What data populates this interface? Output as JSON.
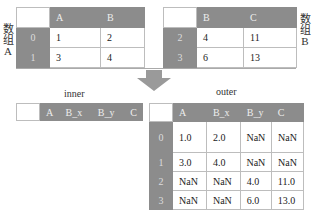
{
  "table_a": {
    "label_chars": [
      "数",
      "组",
      "A"
    ],
    "columns": [
      "A",
      "B"
    ],
    "rows": [
      {
        "index": "0",
        "values": [
          "1",
          "2"
        ]
      },
      {
        "index": "1",
        "values": [
          "3",
          "4"
        ]
      }
    ]
  },
  "table_b": {
    "label_chars": [
      "数",
      "组",
      "B"
    ],
    "columns": [
      "B",
      "C"
    ],
    "rows": [
      {
        "index": "2",
        "values": [
          "4",
          "11"
        ]
      },
      {
        "index": "3",
        "values": [
          "6",
          "13"
        ]
      }
    ]
  },
  "inner": {
    "caption": "inner",
    "columns": [
      "A",
      "B_x",
      "B_y",
      "C"
    ]
  },
  "outer": {
    "caption": "outer",
    "columns": [
      "A",
      "B_x",
      "B_y",
      "C"
    ],
    "rows": [
      {
        "index": "0",
        "values": [
          "1.0",
          "2.0",
          "NaN",
          "NaN"
        ]
      },
      {
        "index": "1",
        "values": [
          "3.0",
          "4.0",
          "NaN",
          "NaN"
        ]
      },
      {
        "index": "2",
        "values": [
          "NaN",
          "NaN",
          "4.0",
          "11.0"
        ]
      },
      {
        "index": "3",
        "values": [
          "NaN",
          "NaN",
          "6.0",
          "13.0"
        ]
      }
    ]
  },
  "colors": {
    "header": "#8c8c8c",
    "border": "#bdbdbd",
    "arrow": "#9a9a9a"
  }
}
